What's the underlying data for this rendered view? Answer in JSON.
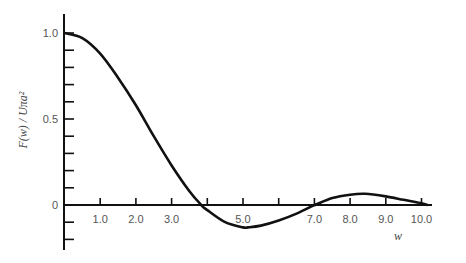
{
  "chart_data": {
    "type": "line",
    "title": "",
    "xlabel": "w",
    "ylabel": "F(w) / Uπa²",
    "x_ticks": [
      "1.0",
      "2.0",
      "3.0",
      "5.0",
      "7.0",
      "8.0",
      "9.0",
      "10.0"
    ],
    "y_ticks": [
      "1.0",
      "0.5",
      "0"
    ],
    "xlim": [
      0,
      10.6
    ],
    "ylim": [
      -0.2,
      1.08
    ],
    "grid": false,
    "legend": null,
    "series": [
      {
        "name": "F(w)/Uπa²",
        "x": [
          0,
          0.5,
          1.0,
          1.5,
          2.0,
          2.5,
          3.0,
          3.5,
          3.83,
          4.0,
          4.5,
          5.0,
          5.14,
          5.5,
          6.0,
          6.5,
          7.0,
          7.02,
          7.5,
          8.0,
          8.42,
          9.0,
          9.5,
          10.0,
          10.17
        ],
        "y": [
          1.0,
          0.97,
          0.88,
          0.74,
          0.58,
          0.4,
          0.23,
          0.08,
          0.0,
          -0.03,
          -0.1,
          -0.13,
          -0.13,
          -0.12,
          -0.09,
          -0.05,
          0.0,
          0.0,
          0.04,
          0.06,
          0.065,
          0.05,
          0.03,
          0.01,
          0.0
        ]
      }
    ]
  }
}
